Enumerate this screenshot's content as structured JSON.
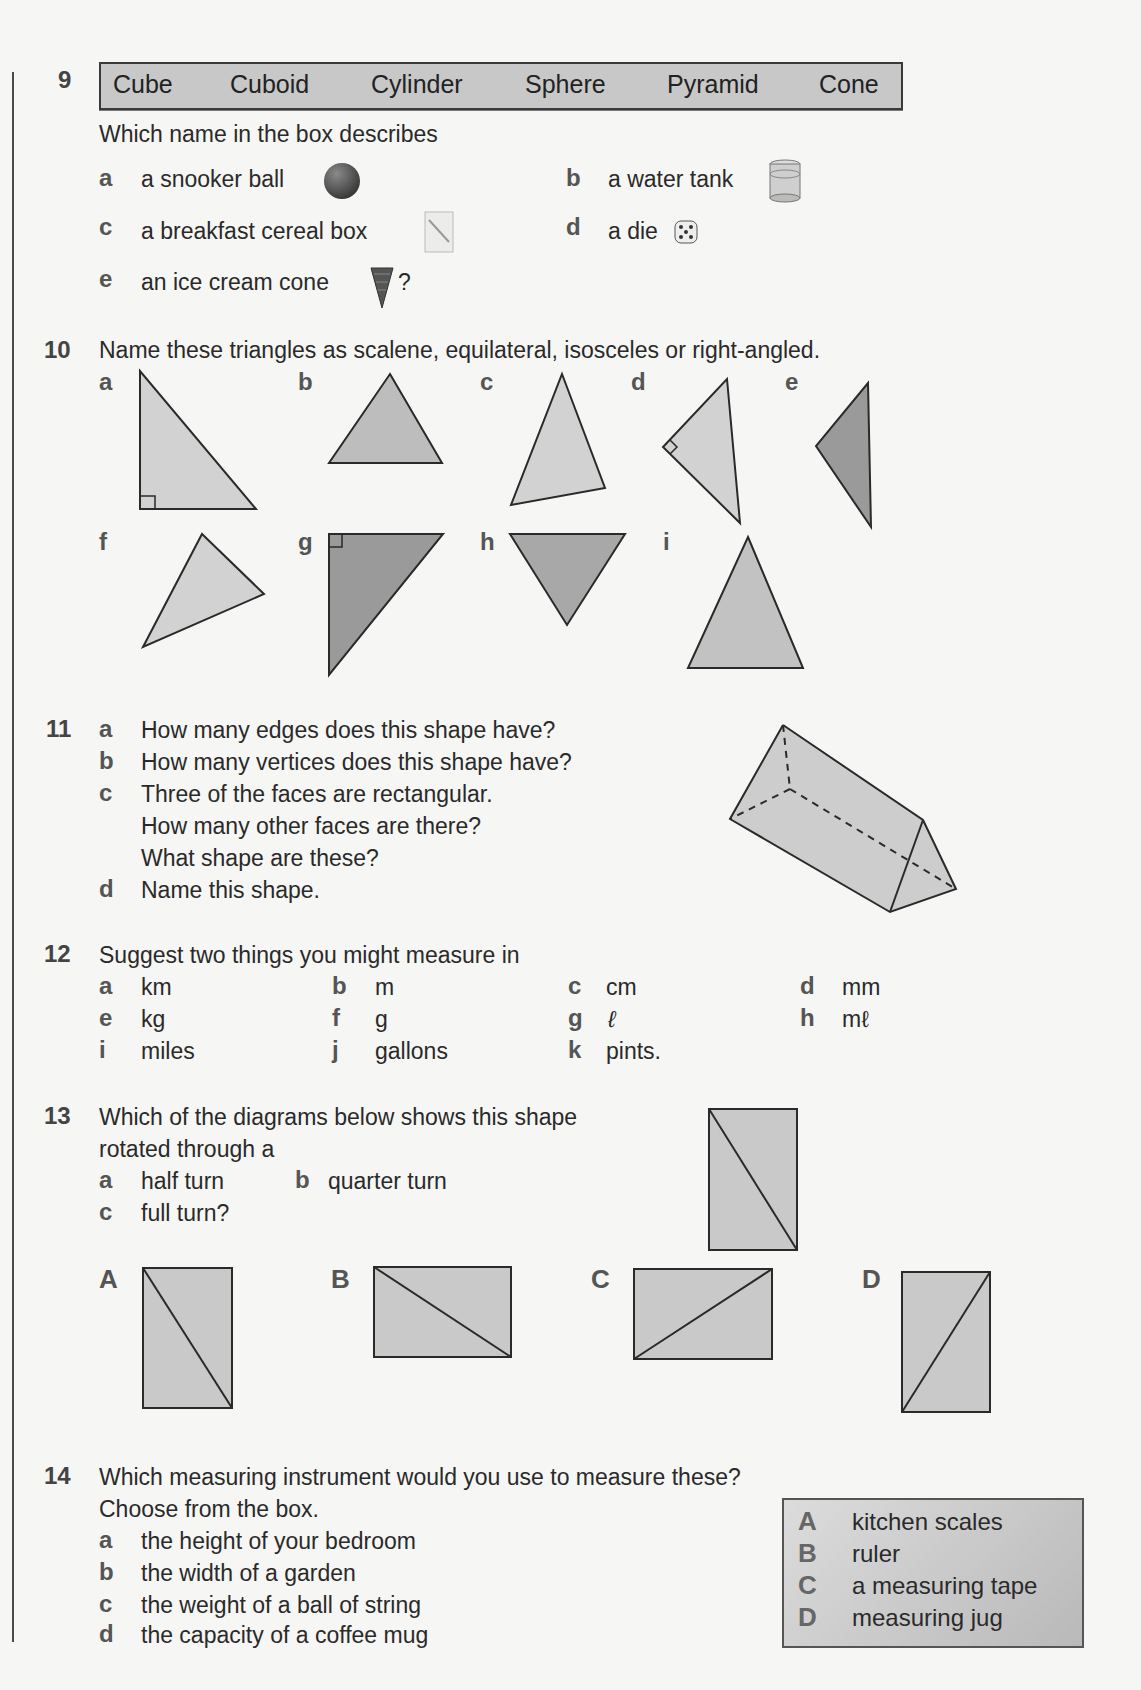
{
  "q9": {
    "number": "9",
    "box_words": [
      "Cube",
      "Cuboid",
      "Cylinder",
      "Sphere",
      "Pyramid",
      "Cone"
    ],
    "prompt": "Which name in the box describes",
    "items": [
      {
        "label": "a",
        "text": "a snooker ball",
        "icon": "snooker-ball-icon"
      },
      {
        "label": "b",
        "text": "a water tank",
        "icon": "water-tank-icon"
      },
      {
        "label": "c",
        "text": "a breakfast cereal box",
        "icon": "cereal-box-icon"
      },
      {
        "label": "d",
        "text": "a die",
        "icon": "die-icon"
      },
      {
        "label": "e",
        "text": "an ice cream cone",
        "icon": "ice-cream-cone-icon",
        "suffix": "?"
      }
    ]
  },
  "q10": {
    "number": "10",
    "prompt": "Name these triangles as scalene, equilateral, isosceles or right-angled.",
    "triangles": [
      {
        "label": "a",
        "shade": "light",
        "right_angle": true
      },
      {
        "label": "b",
        "shade": "mid",
        "right_angle": false
      },
      {
        "label": "c",
        "shade": "light",
        "right_angle": false
      },
      {
        "label": "d",
        "shade": "light",
        "right_angle": true
      },
      {
        "label": "e",
        "shade": "dark",
        "right_angle": false
      },
      {
        "label": "f",
        "shade": "light",
        "right_angle": false
      },
      {
        "label": "g",
        "shade": "dark",
        "right_angle": true
      },
      {
        "label": "h",
        "shade": "dark",
        "right_angle": false
      },
      {
        "label": "i",
        "shade": "mid",
        "right_angle": false
      }
    ]
  },
  "q11": {
    "number": "11",
    "items": [
      {
        "label": "a",
        "lines": [
          "How many edges does this shape have?"
        ]
      },
      {
        "label": "b",
        "lines": [
          "How many vertices does this shape have?"
        ]
      },
      {
        "label": "c",
        "lines": [
          "Three of the faces are rectangular.",
          "How many other faces are there?",
          "What shape are these?"
        ]
      },
      {
        "label": "d",
        "lines": [
          "Name this shape."
        ]
      }
    ]
  },
  "q12": {
    "number": "12",
    "prompt": "Suggest two things you might measure in",
    "units": [
      {
        "label": "a",
        "unit": "km"
      },
      {
        "label": "b",
        "unit": "m"
      },
      {
        "label": "c",
        "unit": "cm"
      },
      {
        "label": "d",
        "unit": "mm"
      },
      {
        "label": "e",
        "unit": "kg"
      },
      {
        "label": "f",
        "unit": "g"
      },
      {
        "label": "g",
        "unit": "ℓ"
      },
      {
        "label": "h",
        "unit": "mℓ"
      },
      {
        "label": "i",
        "unit": "miles"
      },
      {
        "label": "j",
        "unit": "gallons"
      },
      {
        "label": "k",
        "unit": "pints."
      }
    ]
  },
  "q13": {
    "number": "13",
    "prompt_line1": "Which of the diagrams below shows this shape",
    "prompt_line2": "rotated through a",
    "items": [
      {
        "label": "a",
        "text": "half turn"
      },
      {
        "label": "b",
        "text": "quarter turn"
      },
      {
        "label": "c",
        "text": "full turn?"
      }
    ],
    "options": [
      "A",
      "B",
      "C",
      "D"
    ]
  },
  "q14": {
    "number": "14",
    "prompt_line1": "Which measuring instrument would you use to measure these?",
    "prompt_line2": "Choose from the box.",
    "items": [
      {
        "label": "a",
        "text": "the height of your bedroom"
      },
      {
        "label": "b",
        "text": "the width of a garden"
      },
      {
        "label": "c",
        "text": "the weight of a ball of string"
      },
      {
        "label": "d",
        "text": "the capacity of a coffee mug"
      }
    ],
    "instruments": [
      {
        "label": "A",
        "text": "kitchen scales"
      },
      {
        "label": "B",
        "text": "ruler"
      },
      {
        "label": "C",
        "text": "a measuring tape"
      },
      {
        "label": "D",
        "text": "measuring jug"
      }
    ]
  },
  "colors": {
    "shade_light": "#d2d2d2",
    "shade_mid": "#bdbdbd",
    "shade_dark": "#9a9a9a",
    "outline": "#2a2a2a",
    "box_fill": "#c8c8c8"
  }
}
